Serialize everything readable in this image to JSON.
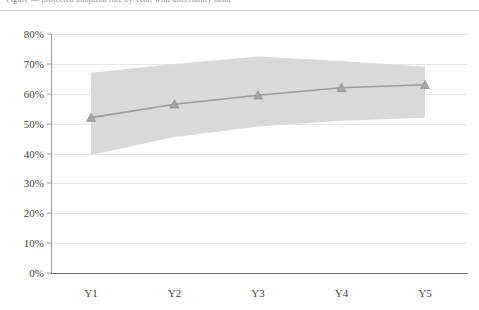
{
  "header": {
    "clipped_text": "Figure — projected adoption rate by year, with uncertainty band"
  },
  "chart_data": {
    "type": "line",
    "title": "",
    "subtitle": "",
    "xlabel": "",
    "ylabel": "",
    "categories": [
      "Y1",
      "Y2",
      "Y3",
      "Y4",
      "Y5"
    ],
    "series": [
      {
        "name": "Projected rate",
        "values": [
          52,
          56.5,
          59.5,
          62,
          63
        ],
        "color": "#9a9a9a",
        "marker": "triangle",
        "marker_color": "#a6a6a6"
      }
    ],
    "band": {
      "name": "Uncertainty band",
      "upper": [
        67,
        70,
        72.5,
        71,
        69
      ],
      "lower": [
        39.5,
        45.5,
        49,
        51,
        52
      ],
      "color": "#d9d9d9"
    },
    "ylim": [
      0,
      80
    ],
    "ytick_values": [
      0,
      10,
      20,
      30,
      40,
      50,
      60,
      70,
      80
    ],
    "ytick_labels": [
      "0%",
      "10%",
      "20%",
      "30%",
      "40%",
      "50%",
      "60%",
      "70%",
      "80%"
    ],
    "xtick_labels": [
      "Y1",
      "Y2",
      "Y3",
      "Y4",
      "Y5"
    ],
    "grid": true,
    "grid_axis": "y",
    "legend": false,
    "legend_position": "none"
  }
}
